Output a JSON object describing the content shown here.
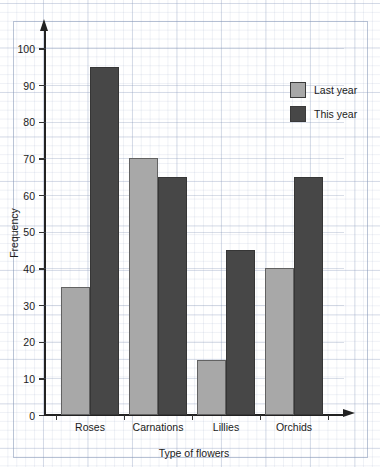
{
  "chart_data": {
    "type": "bar",
    "title": "",
    "xlabel": "Type of flowers",
    "ylabel": "Frequency",
    "categories": [
      "Roses",
      "Carnations",
      "Lillies",
      "Orchids"
    ],
    "series": [
      {
        "name": "Last year",
        "color": "#a8a8a8",
        "values": [
          35,
          70,
          15,
          40
        ]
      },
      {
        "name": "This year",
        "color": "#474747",
        "values": [
          95,
          65,
          45,
          65
        ]
      }
    ],
    "ylim": [
      0,
      105
    ],
    "yticks": [
      0,
      10,
      20,
      30,
      40,
      50,
      60,
      70,
      80,
      90,
      100
    ],
    "ytick_labels": [
      "0",
      "10",
      "20",
      "30",
      "40",
      "50",
      "60",
      "70",
      "80",
      "90",
      "100"
    ],
    "grid": true,
    "grid_style": "graph-paper",
    "legend_position": "top-right",
    "axis_arrows": true
  }
}
